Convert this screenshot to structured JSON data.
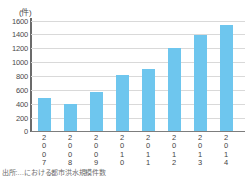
{
  "chart_data": {
    "type": "bar",
    "title": "",
    "subtitle": "",
    "xlabel": "(年)",
    "ylabel": "(件)",
    "ylim": [
      0,
      1700
    ],
    "grid": true,
    "legend": false,
    "categories": [
      "2007",
      "2008",
      "2009",
      "2010",
      "2011",
      "2012",
      "2013",
      "2014"
    ],
    "values": [
      515,
      425,
      605,
      865,
      955,
      1290,
      1485,
      1635
    ],
    "yticks": [
      0,
      200,
      400,
      600,
      800,
      1000,
      1200,
      1400,
      1600
    ],
    "ytick_labels": [
      "0",
      "200",
      "400",
      "600",
      "800",
      "1000",
      "1200",
      "1400",
      "1600"
    ],
    "series": [
      {
        "name": "件数",
        "color": "#6ec6ee",
        "values": [
          515,
          425,
          605,
          865,
          955,
          1290,
          1485,
          1635
        ]
      }
    ]
  },
  "axes": {
    "y_unit_label": "(件)",
    "x_unit_label": "(年)",
    "tick_labels": [
      "1600",
      "1400",
      "1200",
      "1000",
      "800",
      "600",
      "400",
      "200",
      "0"
    ],
    "category_labels": [
      {
        "digits": [
          "2",
          "0",
          "0",
          "7"
        ]
      },
      {
        "digits": [
          "2",
          "0",
          "0",
          "8"
        ]
      },
      {
        "digits": [
          "2",
          "0",
          "0",
          "9"
        ]
      },
      {
        "digits": [
          "2",
          "0",
          "1",
          "0"
        ]
      },
      {
        "digits": [
          "2",
          "0",
          "1",
          "1"
        ]
      },
      {
        "digits": [
          "2",
          "0",
          "1",
          "2"
        ]
      },
      {
        "digits": [
          "2",
          "0",
          "1",
          "3"
        ]
      },
      {
        "digits": [
          "2",
          "0",
          "1",
          "4"
        ]
      }
    ]
  },
  "caption": {
    "source": "出所:…における都市洪水規模件数"
  },
  "colors": {
    "bar": "#6ec6ee",
    "grid": "#d9d9d9",
    "axis": "#6b6b6b",
    "text": "#4a4a4a"
  }
}
